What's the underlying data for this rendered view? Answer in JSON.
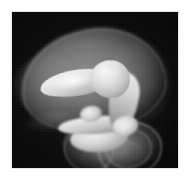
{
  "figure": {
    "kind": "volume-rendered-grayscale-image",
    "modality": "3d-volume-rendering",
    "caption": "",
    "page_background": "#ffffff",
    "panel_background": "#050505",
    "panel": {
      "x": 12,
      "y": 12,
      "width": 166,
      "height": 156,
      "border_color": "#cfcfcf"
    },
    "palette": {
      "background": "#050505",
      "membrane_grey": "#8a8a8a",
      "membrane_rim": "#a8a8a8",
      "bone_bright": "#f2f2f2",
      "bone_mid": "#c0c0c0",
      "bone_shadow": "#6e6e6e",
      "sac_translucent": "#9a9a9a",
      "sac_outline": "#c6c6c6"
    },
    "structures": [
      {
        "name": "translucent-outer-membrane",
        "tone": "mid-grey",
        "opacity": "semi-transparent",
        "region": "upper-centre"
      },
      {
        "name": "bright-upper-limb-segment",
        "tone": "near-white",
        "opacity": "opaque",
        "region": "centre-left"
      },
      {
        "name": "bright-joint-head",
        "tone": "near-white",
        "opacity": "opaque",
        "region": "centre"
      },
      {
        "name": "bright-curved-forearm",
        "tone": "light-grey",
        "opacity": "opaque",
        "region": "centre-right"
      },
      {
        "name": "bright-lower-bar-segment",
        "tone": "light-grey",
        "opacity": "opaque",
        "region": "centre-lower"
      },
      {
        "name": "translucent-lower-sac",
        "tone": "mid-grey",
        "opacity": "semi-transparent",
        "region": "lower-centre"
      },
      {
        "name": "sac-ring-outline",
        "tone": "light-grey",
        "opacity": "outline",
        "region": "lower-right"
      },
      {
        "name": "faint-tissue-wisp",
        "tone": "dark-grey",
        "opacity": "faint",
        "region": "lower-left"
      }
    ]
  }
}
